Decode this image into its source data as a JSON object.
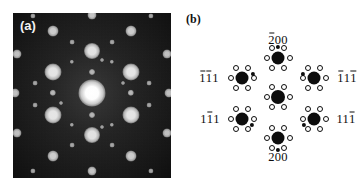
{
  "figure": {
    "panels": [
      {
        "id": "a",
        "label": "(a)",
        "type": "experimental-diffraction-pattern",
        "background_color": "#1d1d1d",
        "spot_color": "#ffffff"
      },
      {
        "id": "b",
        "label": "(b)",
        "type": "indexed-schematic",
        "background_color": "#ffffff",
        "node_color": "#0d0d0d"
      }
    ]
  },
  "chart_data": {
    "type": "scatter",
    "title": "",
    "xlabel": "",
    "ylabel": "",
    "panel_a": {
      "description": "Electron diffraction pattern: bright reflections on dark background",
      "center": [
        79,
        80
      ],
      "spots": [
        {
          "x": 79,
          "y": 80,
          "r": 13.5,
          "intensity": 1.0
        },
        {
          "x": 79,
          "y": 38,
          "r": 8.0,
          "intensity": 0.8
        },
        {
          "x": 79,
          "y": 122,
          "r": 8.0,
          "intensity": 0.8
        },
        {
          "x": 40,
          "y": 59,
          "r": 8.5,
          "intensity": 0.82
        },
        {
          "x": 118,
          "y": 59,
          "r": 8.5,
          "intensity": 0.82
        },
        {
          "x": 40,
          "y": 102,
          "r": 8.5,
          "intensity": 0.82
        },
        {
          "x": 118,
          "y": 102,
          "r": 8.5,
          "intensity": 0.82
        },
        {
          "x": 79,
          "y": 2,
          "r": 4.5,
          "intensity": 0.62
        },
        {
          "x": 79,
          "y": 158,
          "r": 4.5,
          "intensity": 0.62
        },
        {
          "x": 2,
          "y": 80,
          "r": 4.5,
          "intensity": 0.58
        },
        {
          "x": 156,
          "y": 80,
          "r": 4.5,
          "intensity": 0.58
        },
        {
          "x": 40,
          "y": 18,
          "r": 5.5,
          "intensity": 0.66
        },
        {
          "x": 118,
          "y": 18,
          "r": 5.5,
          "intensity": 0.66
        },
        {
          "x": 40,
          "y": 143,
          "r": 5.5,
          "intensity": 0.66
        },
        {
          "x": 118,
          "y": 143,
          "r": 5.5,
          "intensity": 0.66
        },
        {
          "x": 4,
          "y": 41,
          "r": 4.5,
          "intensity": 0.58
        },
        {
          "x": 154,
          "y": 41,
          "r": 4.5,
          "intensity": 0.58
        },
        {
          "x": 4,
          "y": 120,
          "r": 4.5,
          "intensity": 0.58
        },
        {
          "x": 154,
          "y": 120,
          "r": 4.5,
          "intensity": 0.58
        },
        {
          "x": 40,
          "y": 80,
          "r": 3.2,
          "intensity": 0.5
        },
        {
          "x": 118,
          "y": 80,
          "r": 3.2,
          "intensity": 0.5
        },
        {
          "x": 79,
          "y": 59,
          "r": 3.0,
          "intensity": 0.46
        },
        {
          "x": 79,
          "y": 102,
          "r": 3.0,
          "intensity": 0.46
        },
        {
          "x": 20,
          "y": 3,
          "r": 2.6,
          "intensity": 0.4
        },
        {
          "x": 138,
          "y": 3,
          "r": 2.6,
          "intensity": 0.4
        },
        {
          "x": 20,
          "y": 158,
          "r": 2.6,
          "intensity": 0.4
        },
        {
          "x": 138,
          "y": 158,
          "r": 2.6,
          "intensity": 0.4
        },
        {
          "x": 59,
          "y": 29,
          "r": 2.4,
          "intensity": 0.38
        },
        {
          "x": 99,
          "y": 29,
          "r": 2.4,
          "intensity": 0.38
        },
        {
          "x": 59,
          "y": 132,
          "r": 2.4,
          "intensity": 0.38
        },
        {
          "x": 99,
          "y": 132,
          "r": 2.4,
          "intensity": 0.38
        },
        {
          "x": 22,
          "y": 70,
          "r": 2.4,
          "intensity": 0.38
        },
        {
          "x": 136,
          "y": 70,
          "r": 2.4,
          "intensity": 0.38
        },
        {
          "x": 22,
          "y": 92,
          "r": 2.4,
          "intensity": 0.38
        },
        {
          "x": 136,
          "y": 92,
          "r": 2.4,
          "intensity": 0.38
        },
        {
          "x": 59,
          "y": 49,
          "r": 2.2,
          "intensity": 0.34
        },
        {
          "x": 99,
          "y": 49,
          "r": 2.2,
          "intensity": 0.34
        },
        {
          "x": 59,
          "y": 112,
          "r": 2.2,
          "intensity": 0.34
        },
        {
          "x": 99,
          "y": 112,
          "r": 2.2,
          "intensity": 0.34
        },
        {
          "x": 89,
          "y": 47,
          "r": 2.0,
          "intensity": 0.32
        },
        {
          "x": 89,
          "y": 114,
          "r": 2.0,
          "intensity": 0.32
        },
        {
          "x": 48,
          "y": 90,
          "r": 2.0,
          "intensity": 0.32
        },
        {
          "x": 110,
          "y": 70,
          "r": 2.0,
          "intensity": 0.32
        }
      ]
    },
    "panel_b": {
      "description": "Schematic of indexed diffraction clusters with matrix and twin reflections",
      "clusters": [
        {
          "name": "center",
          "cx": 100,
          "cy": 97,
          "main_r": 7.0,
          "has_small": false,
          "label": null
        },
        {
          "name": "top",
          "cx": 100,
          "cy": 58,
          "main_r": 6.5,
          "has_small": true,
          "small_angle": 90,
          "label": "2̄00"
        },
        {
          "name": "bottom",
          "cx": 100,
          "cy": 138,
          "main_r": 6.5,
          "has_small": true,
          "small_angle": 270,
          "label": "200"
        },
        {
          "name": "upper-left",
          "cx": 64,
          "cy": 78,
          "main_r": 6.5,
          "has_small": true,
          "small_angle": 20,
          "label": "1̄1̄1"
        },
        {
          "name": "upper-right",
          "cx": 136,
          "cy": 78,
          "main_r": 6.5,
          "has_small": true,
          "small_angle": 160,
          "label": "1̄ 1 1̄"
        },
        {
          "name": "lower-left",
          "cx": 64,
          "cy": 119,
          "main_r": 6.5,
          "small_angle": 330,
          "has_small": true,
          "label": "1 1̄ 1"
        },
        {
          "name": "lower-right",
          "cx": 136,
          "cy": 119,
          "main_r": 6.5,
          "small_angle": 210,
          "has_small": true,
          "label": "1 1 1̄"
        }
      ],
      "satellite_ring": {
        "count": 6,
        "radius": 11.5,
        "open_r": 3.0
      }
    }
  },
  "labels": {
    "panel_a": "(a)",
    "panel_b": "(b)",
    "indices": {
      "top": {
        "digits": "200",
        "bars": [
          0
        ],
        "text": "200"
      },
      "bottom": {
        "digits": "200",
        "bars": [],
        "text": "200"
      },
      "upper_left": {
        "digits": "111",
        "bars": [
          0,
          1
        ],
        "text": "111"
      },
      "upper_right": {
        "digits": "111",
        "bars": [
          0,
          2
        ],
        "text": "111"
      },
      "lower_left": {
        "digits": "111",
        "bars": [
          1
        ],
        "text": "111"
      },
      "lower_right": {
        "digits": "111",
        "bars": [
          2
        ],
        "text": "111"
      }
    }
  }
}
